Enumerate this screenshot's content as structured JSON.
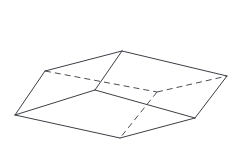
{
  "figure": {
    "type": "3d-solid-wireframe",
    "shape_name": "oblique prism",
    "background_color": "#ffffff",
    "solid_edge_color": "#3b3f45",
    "hidden_edge_color": "#4a4e55",
    "edge_width": 1,
    "hidden_edge_dash": "6 4",
    "canvas": {
      "width": 242,
      "height": 157
    },
    "vertices": {
      "top_back_left": {
        "x": 45,
        "y": 71
      },
      "top_back_right": {
        "x": 122,
        "y": 51
      },
      "top_front_right": {
        "x": 227,
        "y": 76
      },
      "top_front_left": {
        "x": 157,
        "y": 92
      },
      "bottom_back_left": {
        "x": 15,
        "y": 115
      },
      "bottom_back_right": {
        "x": 95,
        "y": 90
      },
      "bottom_front_right": {
        "x": 195,
        "y": 118
      },
      "bottom_front_left": {
        "x": 120,
        "y": 138
      }
    },
    "edges_solid": [
      {
        "name": "top-back-left-to-top-back-right",
        "from": "top_back_left",
        "to": "top_back_right"
      },
      {
        "name": "top-back-right-to-top-front-right",
        "from": "top_back_right",
        "to": "top_front_right"
      },
      {
        "name": "top-back-left-to-bottom-back-left",
        "from": "top_back_left",
        "to": "bottom_back_left"
      },
      {
        "name": "top-back-right-to-bottom-back-right",
        "from": "top_back_right",
        "to": "bottom_back_right"
      },
      {
        "name": "top-front-right-to-bottom-front-right",
        "from": "top_front_right",
        "to": "bottom_front_right"
      },
      {
        "name": "bottom-back-left-to-bottom-back-right",
        "from": "bottom_back_left",
        "to": "bottom_back_right"
      },
      {
        "name": "bottom-back-right-to-bottom-front-right",
        "from": "bottom_back_right",
        "to": "bottom_front_right"
      },
      {
        "name": "bottom-back-left-to-bottom-front-left",
        "from": "bottom_back_left",
        "to": "bottom_front_left"
      },
      {
        "name": "bottom-front-left-to-bottom-front-right",
        "from": "bottom_front_left",
        "to": "bottom_front_right"
      }
    ],
    "edges_hidden": [
      {
        "name": "top-back-left-to-top-front-left",
        "from": "top_back_left",
        "to": "top_front_left"
      },
      {
        "name": "top-front-left-to-top-front-right",
        "from": "top_front_left",
        "to": "top_front_right"
      },
      {
        "name": "top-front-left-to-bottom-front-left",
        "from": "top_front_left",
        "to": "bottom_front_left"
      }
    ]
  }
}
